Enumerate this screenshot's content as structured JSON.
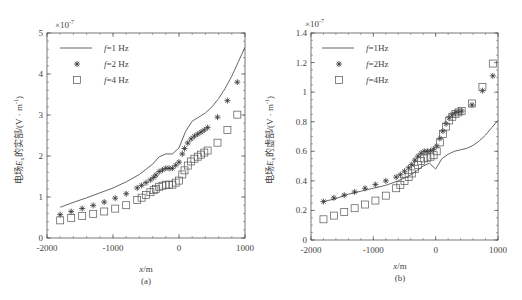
{
  "chart_data": [
    {
      "type": "line",
      "panel": "(a)",
      "title": "",
      "xlabel": "x/m",
      "ylabel": "电场Ex的实部/(V·m⁻¹)",
      "y_multiplier": "×10⁻⁷",
      "xlim": [
        -2000,
        1000
      ],
      "ylim": [
        0,
        5
      ],
      "xticks": [
        "-2000",
        "-1000",
        "0",
        "1000"
      ],
      "yticks": [
        "0",
        "1",
        "2",
        "3",
        "4",
        "5"
      ],
      "grid": false,
      "legend_position": "upper left",
      "x": [
        -1800,
        -1600,
        -1400,
        -1200,
        -1000,
        -800,
        -600,
        -400,
        -300,
        -200,
        -100,
        0,
        100,
        200,
        300,
        400,
        500,
        600,
        700,
        800,
        900,
        1000
      ],
      "series": [
        {
          "name": "f=1 Hz",
          "marker": "line",
          "values": [
            0.75,
            0.87,
            0.98,
            1.1,
            1.22,
            1.37,
            1.55,
            1.8,
            1.98,
            2.05,
            2.05,
            2.2,
            2.6,
            2.85,
            2.95,
            3.05,
            3.2,
            3.4,
            3.65,
            3.95,
            4.3,
            4.65
          ]
        },
        {
          "name": "f=2 Hz",
          "marker": "asterisk",
          "values": [
            0.57,
            0.66,
            0.75,
            0.84,
            0.95,
            1.08,
            1.25,
            1.45,
            1.62,
            1.7,
            1.7,
            1.85,
            2.25,
            2.45,
            2.55,
            2.65,
            2.78,
            2.98,
            3.25,
            3.55,
            3.85,
            4.2
          ]
        },
        {
          "name": "f=4 Hz",
          "marker": "square",
          "values": [
            0.43,
            0.5,
            0.56,
            0.62,
            0.7,
            0.8,
            0.95,
            1.15,
            1.25,
            1.3,
            1.3,
            1.4,
            1.7,
            1.9,
            2.0,
            2.1,
            2.2,
            2.35,
            2.55,
            2.8,
            3.05,
            3.4
          ]
        }
      ]
    },
    {
      "type": "line",
      "panel": "(b)",
      "title": "",
      "xlabel": "x/m",
      "ylabel": "电场Ex的虚部/(V·m⁻¹)",
      "y_multiplier": "×10⁻⁷",
      "xlim": [
        -2000,
        1000
      ],
      "ylim": [
        0,
        1.4
      ],
      "xticks": [
        "-2000",
        "-1000",
        "0",
        "1000"
      ],
      "yticks": [
        "0",
        "0.2",
        "0.4",
        "0.6",
        "0.8",
        "1",
        "1.2",
        "1.4"
      ],
      "grid": false,
      "legend_position": "upper left",
      "x": [
        -1800,
        -1600,
        -1400,
        -1200,
        -1000,
        -800,
        -600,
        -400,
        -300,
        -200,
        -100,
        0,
        100,
        200,
        300,
        400,
        500,
        600,
        700,
        800,
        900,
        1000
      ],
      "series": [
        {
          "name": "f=1Hz",
          "marker": "line",
          "values": [
            0.26,
            0.28,
            0.31,
            0.33,
            0.35,
            0.37,
            0.4,
            0.44,
            0.47,
            0.5,
            0.52,
            0.48,
            0.55,
            0.58,
            0.6,
            0.61,
            0.62,
            0.64,
            0.67,
            0.71,
            0.76,
            0.81
          ]
        },
        {
          "name": "f=2Hz",
          "marker": "asterisk",
          "values": [
            0.26,
            0.29,
            0.31,
            0.34,
            0.37,
            0.4,
            0.43,
            0.5,
            0.56,
            0.6,
            0.6,
            0.62,
            0.72,
            0.82,
            0.86,
            0.87,
            0.88,
            0.92,
            0.98,
            1.04,
            1.1,
            1.16
          ]
        },
        {
          "name": "f=4Hz",
          "marker": "square",
          "values": [
            0.14,
            0.17,
            0.2,
            0.23,
            0.26,
            0.3,
            0.36,
            0.44,
            0.5,
            0.55,
            0.56,
            0.58,
            0.7,
            0.8,
            0.85,
            0.87,
            0.89,
            0.93,
            1.0,
            1.07,
            1.16,
            1.36
          ]
        }
      ]
    }
  ],
  "panels": {
    "a": {
      "multiplier_base": "×10",
      "multiplier_exp": "-7",
      "ylabel_prefix": "电场",
      "ylabel_var": "E",
      "ylabel_sub": "x",
      "ylabel_suffix": "的实部/(V · m",
      "ylabel_exp": "-1",
      "ylabel_close": ")",
      "xlabel_var": "x",
      "xlabel_unit": "/m",
      "caption": "(a)",
      "legend": [
        {
          "f": "f",
          "rest": "=1 Hz"
        },
        {
          "f": "f",
          "rest": "=2 Hz"
        },
        {
          "f": "f",
          "rest": "=4 Hz"
        }
      ]
    },
    "b": {
      "multiplier_base": "×10",
      "multiplier_exp": "-7",
      "ylabel_prefix": "电场",
      "ylabel_var": "E",
      "ylabel_sub": "x",
      "ylabel_suffix": "的虚部/(V · m",
      "ylabel_exp": "-1",
      "ylabel_close": ")",
      "xlabel_var": "x",
      "xlabel_unit": "/m",
      "caption": "(b)",
      "legend": [
        {
          "f": "f",
          "rest": "=1Hz"
        },
        {
          "f": "f",
          "rest": "=2Hz"
        },
        {
          "f": "f",
          "rest": "=4Hz"
        }
      ]
    }
  },
  "colors": {
    "line": "#555555",
    "axis": "#555555",
    "text": "#444444"
  }
}
